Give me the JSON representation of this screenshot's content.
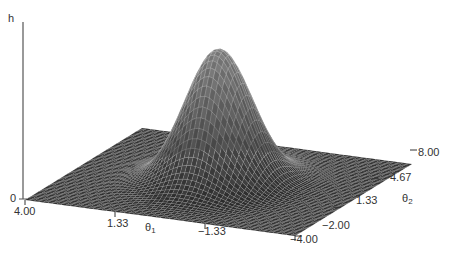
{
  "chart_data": {
    "type": "surface",
    "title": "",
    "zlabel": "h",
    "xlabel": "θ1",
    "ylabel": "θ2",
    "z_ticks": [
      "0"
    ],
    "x_ticks": [
      "4.00",
      "1.33",
      "-1.33",
      "-4.00"
    ],
    "y_ticks": [
      "-2.00",
      "1.33",
      "4.67",
      "8.00"
    ],
    "x_range": [
      4.0,
      -4.0
    ],
    "y_range": [
      -2.0,
      8.0
    ],
    "peak": {
      "theta1": 0,
      "theta2": 3,
      "sigma1": 0.9,
      "sigma2": 1.4
    },
    "grid": false,
    "legend": null
  },
  "labels": {
    "z_axis": "h",
    "z_zero": "0",
    "theta1_main": "θ",
    "theta1_sub": "1",
    "theta2_main": "θ",
    "theta2_sub": "2",
    "x_tick_0": "4.00",
    "x_tick_1": "1.33",
    "x_tick_2": "−1.33",
    "x_tick_3": "−4.00",
    "y_tick_0": "−2.00",
    "y_tick_1": "1.33",
    "y_tick_2": "4.67",
    "y_tick_3": "8.00"
  },
  "colors": {
    "mesh_line": "#e8e8e8",
    "mesh_fill_dark": "#2a2a2a",
    "mesh_fill_light": "#6a6a6a",
    "axis": "#444444"
  }
}
